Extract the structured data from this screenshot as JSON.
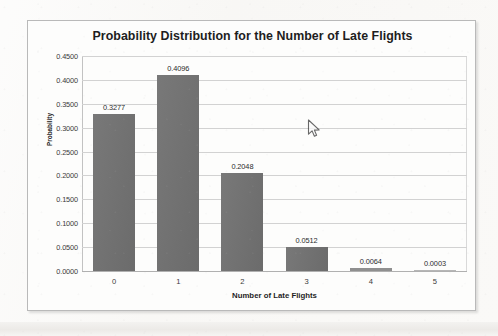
{
  "chart_data": {
    "type": "bar",
    "title": "Probability Distribution for the Number of Late Flights",
    "xlabel": "Number of Late Flights",
    "ylabel": "Probability",
    "categories": [
      "0",
      "1",
      "2",
      "3",
      "4",
      "5"
    ],
    "values": [
      0.3277,
      0.4096,
      0.2048,
      0.0512,
      0.0064,
      0.0003
    ],
    "data_labels": [
      "0.3277",
      "0.4096",
      "0.2048",
      "0.0512",
      "0.0064",
      "0.0003"
    ],
    "ylim": [
      0.0,
      0.45
    ],
    "ytick_step": 0.05,
    "ytick_labels": [
      "0.4500",
      "0.4000",
      "0.3500",
      "0.3000",
      "0.2500",
      "0.2000",
      "0.1500",
      "0.1000",
      "0.0500",
      "0.0000"
    ],
    "ytick_values": [
      0.45,
      0.4,
      0.35,
      0.3,
      0.25,
      0.2,
      0.15,
      0.1,
      0.05,
      0.0
    ],
    "grid": true,
    "grid_axis": "y",
    "legend": false,
    "legend_position": "none",
    "bar_color": "#717171",
    "series": [
      {
        "name": "Probability",
        "values": [
          0.3277,
          0.4096,
          0.2048,
          0.0512,
          0.0064,
          0.0003
        ]
      }
    ]
  },
  "cursor": {
    "icon": "mouse-pointer-icon",
    "x": 282,
    "y": 105
  }
}
